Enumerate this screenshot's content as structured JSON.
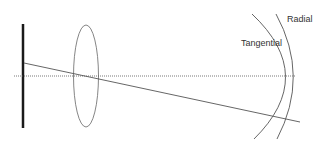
{
  "diagram": {
    "title": "",
    "labels": {
      "radial": "Radial",
      "tangential": "Tangential"
    },
    "elements": {
      "object_plane": "thick vertical bar (object)",
      "lens": "ellipse lens",
      "optical_axis": "dotted horizontal line",
      "ray": "oblique chief ray",
      "tangential_surface": "tangential focal surface arc",
      "radial_surface": "radial (sagittal) focal surface arc"
    },
    "colors": {
      "object_plane": "#1a1a1a",
      "lines": "#555555",
      "text": "#333333",
      "background": "#ffffff"
    }
  }
}
